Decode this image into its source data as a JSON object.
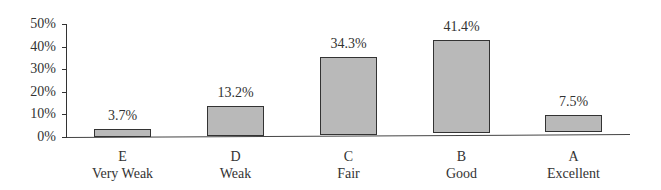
{
  "chart_data": {
    "type": "bar",
    "title": "",
    "xlabel": "",
    "ylabel": "",
    "ylim": [
      0,
      50
    ],
    "yticks": [
      "0%",
      "10%",
      "20%",
      "30%",
      "40%",
      "50%"
    ],
    "grid": false,
    "legend": null,
    "categories": [
      {
        "grade": "E",
        "label": "Very Weak"
      },
      {
        "grade": "D",
        "label": "Weak"
      },
      {
        "grade": "C",
        "label": "Fair"
      },
      {
        "grade": "B",
        "label": "Good"
      },
      {
        "grade": "A",
        "label": "Excellent"
      }
    ],
    "values": [
      3.7,
      13.2,
      34.3,
      41.4,
      7.5
    ],
    "value_labels": [
      "3.7%",
      "13.2%",
      "34.3%",
      "41.4%",
      "7.5%"
    ],
    "bar_color": "#b9b9b9",
    "bar_edge_color": "#333333"
  }
}
